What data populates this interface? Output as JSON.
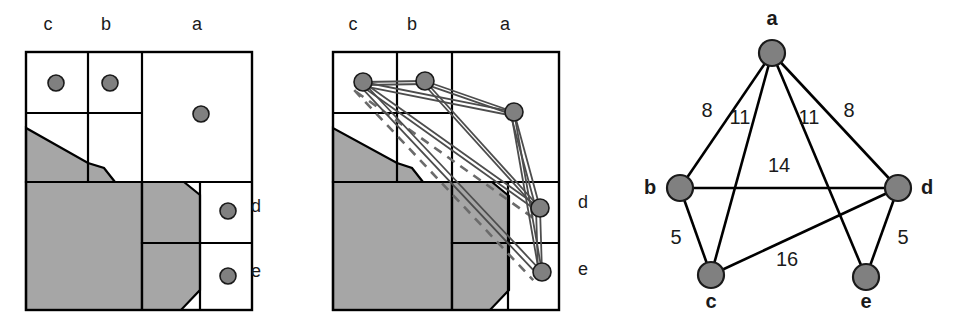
{
  "figure": {
    "title": "",
    "panel_count": 3,
    "colors": {
      "node_fill": "#808080",
      "node_stroke": "#1a1a1a",
      "cell_stroke": "#000000",
      "region_fill": "#a6a6a6",
      "region_stroke": "#000000",
      "edge_solid": "#4d4d4d",
      "edge_dashed": "#6b6b6b",
      "graph_edge": "#000000",
      "label_color": "#1a1a1a",
      "background": "#ffffff"
    }
  },
  "panel1": {
    "name": "grid-partition-with-points",
    "top_labels": [
      {
        "text": "c",
        "x": 48,
        "y": 30
      },
      {
        "text": "b",
        "x": 106,
        "y": 30
      },
      {
        "text": "a",
        "x": 197,
        "y": 30
      }
    ],
    "side_labels": [
      {
        "text": "d",
        "x": 256,
        "y": 212
      },
      {
        "text": "e",
        "x": 256,
        "y": 277
      }
    ],
    "points": [
      {
        "id": "c",
        "x": 56,
        "y": 83,
        "r": 8
      },
      {
        "id": "b",
        "x": 110,
        "y": 83,
        "r": 8
      },
      {
        "id": "a",
        "x": 201,
        "y": 114,
        "r": 8
      },
      {
        "id": "d",
        "x": 228,
        "y": 211,
        "r": 8
      },
      {
        "id": "e",
        "x": 228,
        "y": 276,
        "r": 8
      }
    ],
    "frame": {
      "x": 26,
      "y": 52,
      "w": 226,
      "h": 258
    },
    "grid_lines": [
      {
        "type": "v",
        "x": 88,
        "y1": 52,
        "y2": 182
      },
      {
        "type": "v",
        "x": 142,
        "y1": 52,
        "y2": 310
      },
      {
        "type": "v",
        "x": 200,
        "y1": 182,
        "y2": 310
      },
      {
        "type": "h",
        "y": 113,
        "x1": 26,
        "x2": 142
      },
      {
        "type": "h",
        "y": 182,
        "x1": 26,
        "x2": 252
      },
      {
        "type": "h",
        "y": 243,
        "x1": 142,
        "x2": 252
      }
    ],
    "regions": [
      {
        "name": "upper-wedge",
        "points": "26,128 26,182 115,182 104,168 88,163"
      },
      {
        "name": "lower-block",
        "points": "26,182 142,182 142,310 26,310"
      },
      {
        "name": "mid-right-wedge",
        "points": "142,182 184,182 200,195 200,243 142,243"
      },
      {
        "name": "bottom-right-wedge",
        "points": "142,243 200,243 200,290 181,310 142,310"
      }
    ]
  },
  "panel2": {
    "name": "grid-partition-with-graph-overlay",
    "top_labels": [
      {
        "text": "c",
        "x": 353,
        "y": 30
      },
      {
        "text": "b",
        "x": 412,
        "y": 30
      },
      {
        "text": "a",
        "x": 505,
        "y": 30
      }
    ],
    "side_labels": [
      {
        "text": "d",
        "x": 583,
        "y": 208
      },
      {
        "text": "e",
        "x": 583,
        "y": 275
      }
    ],
    "points": [
      {
        "id": "c",
        "x": 363,
        "y": 82,
        "r": 9
      },
      {
        "id": "b",
        "x": 425,
        "y": 81,
        "r": 9
      },
      {
        "id": "a",
        "x": 514,
        "y": 112,
        "r": 9
      },
      {
        "id": "d",
        "x": 540,
        "y": 208,
        "r": 9
      },
      {
        "id": "e",
        "x": 542,
        "y": 272,
        "r": 9
      }
    ],
    "frame": {
      "x": 333,
      "y": 52,
      "w": 226,
      "h": 258
    },
    "grid_lines": [
      {
        "type": "v",
        "x": 397,
        "y1": 52,
        "y2": 182
      },
      {
        "type": "v",
        "x": 452,
        "y1": 52,
        "y2": 310
      },
      {
        "type": "v",
        "x": 508,
        "y1": 182,
        "y2": 310
      },
      {
        "type": "h",
        "y": 113,
        "x1": 333,
        "x2": 452
      },
      {
        "type": "h",
        "y": 182,
        "x1": 333,
        "x2": 559
      },
      {
        "type": "h",
        "y": 243,
        "x1": 452,
        "x2": 559
      }
    ],
    "regions": [
      {
        "name": "upper-wedge",
        "points": "333,128 333,182 423,182 412,168 397,163"
      },
      {
        "name": "lower-block",
        "points": "333,182 452,182 452,310 333,310"
      },
      {
        "name": "mid-right-wedge",
        "points": "452,182 492,182 509,196 509,243 452,243"
      },
      {
        "name": "bottom-right-wedge",
        "points": "452,243 509,243 509,290 490,310 452,310"
      }
    ],
    "solid_edges": [
      {
        "from": "c",
        "to": "b"
      },
      {
        "from": "c",
        "to": "a"
      },
      {
        "from": "b",
        "to": "a"
      },
      {
        "from": "c",
        "to": "d"
      },
      {
        "from": "b",
        "to": "d"
      },
      {
        "from": "a",
        "to": "d"
      },
      {
        "from": "c",
        "to": "e"
      },
      {
        "from": "a",
        "to": "e"
      },
      {
        "from": "d",
        "to": "e"
      }
    ],
    "dashed_edges": [
      {
        "from": "c",
        "to": "d"
      },
      {
        "from": "c",
        "to": "e"
      }
    ]
  },
  "panel3": {
    "name": "weighted-graph",
    "nodes": [
      {
        "id": "a",
        "x": 772,
        "y": 53,
        "r": 13,
        "label": "a",
        "label_x": 772,
        "label_y": 25
      },
      {
        "id": "b",
        "x": 680,
        "y": 188,
        "r": 13,
        "label": "b",
        "label_x": 650,
        "label_y": 194
      },
      {
        "id": "d",
        "x": 898,
        "y": 188,
        "r": 13,
        "label": "d",
        "label_x": 927,
        "label_y": 194
      },
      {
        "id": "c",
        "x": 711,
        "y": 275,
        "r": 13,
        "label": "c",
        "label_x": 711,
        "label_y": 308
      },
      {
        "id": "e",
        "x": 866,
        "y": 277,
        "r": 13,
        "label": "e",
        "label_x": 866,
        "label_y": 308
      }
    ],
    "edges": [
      {
        "from": "a",
        "to": "b",
        "weight": "8",
        "label_x": 707,
        "label_y": 117
      },
      {
        "from": "a",
        "to": "c",
        "weight": "11",
        "label_x": 740,
        "label_y": 124
      },
      {
        "from": "a",
        "to": "e",
        "weight": "11",
        "label_x": 809,
        "label_y": 124
      },
      {
        "from": "a",
        "to": "d",
        "weight": "8",
        "label_x": 849,
        "label_y": 117
      },
      {
        "from": "b",
        "to": "d",
        "weight": "14",
        "label_x": 779,
        "label_y": 172
      },
      {
        "from": "b",
        "to": "c",
        "weight": "5",
        "label_x": 676,
        "label_y": 244
      },
      {
        "from": "c",
        "to": "d",
        "weight": "16",
        "label_x": 787,
        "label_y": 266
      },
      {
        "from": "d",
        "to": "e",
        "weight": "5",
        "label_x": 903,
        "label_y": 244
      }
    ]
  }
}
